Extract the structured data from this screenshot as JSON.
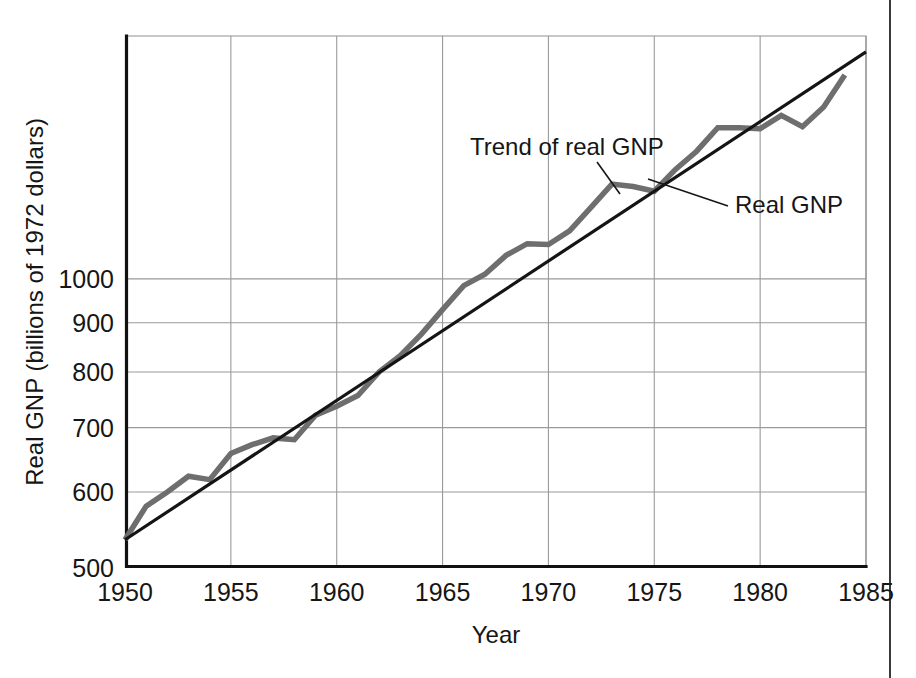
{
  "chart_data": {
    "type": "line",
    "title": "",
    "xlabel": "Year",
    "ylabel": "Real GNP (billions of 1972 dollars)",
    "x_tick_labels": [
      "1950",
      "1955",
      "1960",
      "1965",
      "1970",
      "1975",
      "1980",
      "1985"
    ],
    "x_ticks": [
      1950,
      1955,
      1960,
      1965,
      1970,
      1975,
      1980,
      1985
    ],
    "y_tick_labels": [
      "500",
      "600",
      "700",
      "800",
      "900",
      "1000"
    ],
    "y_ticks": [
      500,
      600,
      700,
      800,
      900,
      1000
    ],
    "yscale": "log",
    "xlim": [
      1950,
      1985
    ],
    "ylim": [
      500,
      1790
    ],
    "grid": true,
    "legend_position": "inline-annotations",
    "series": [
      {
        "name": "Real GNP",
        "color": "#6e6e6e",
        "width": 5.5,
        "x": [
          1950,
          1951,
          1952,
          1953,
          1954,
          1955,
          1956,
          1957,
          1958,
          1959,
          1960,
          1961,
          1962,
          1963,
          1964,
          1965,
          1966,
          1967,
          1968,
          1969,
          1970,
          1971,
          1972,
          1973,
          1974,
          1975,
          1976,
          1977,
          1978,
          1979,
          1980,
          1981,
          1982,
          1983,
          1984
        ],
        "values": [
          535,
          580,
          600,
          623,
          618,
          658,
          672,
          683,
          680,
          721,
          737,
          756,
          800,
          832,
          876,
          929,
          984,
          1011,
          1058,
          1088,
          1086,
          1122,
          1186,
          1255,
          1248,
          1234,
          1300,
          1358,
          1437,
          1437,
          1433,
          1480,
          1440,
          1510,
          1630
        ]
      },
      {
        "name": "Trend of real GNP",
        "color": "#141414",
        "width": 3.2,
        "x": [
          1950,
          1985
        ],
        "values": [
          535,
          1723
        ]
      }
    ],
    "annotations": [
      {
        "name": "trend-of-real-gnp",
        "text": "Trend of real GNP",
        "text_x": 470,
        "text_y": 155,
        "leader": [
          [
            597,
            162
          ],
          [
            620,
            194
          ]
        ]
      },
      {
        "name": "real-gnp",
        "text": "Real GNP",
        "text_x": 735,
        "text_y": 213,
        "leader": [
          [
            728,
            206
          ],
          [
            648,
            179
          ]
        ]
      }
    ],
    "colors": {
      "series_real_gnp": "#6e6e6e",
      "series_trend": "#141414",
      "gridline": "#9a9a9a",
      "axis": "#111111",
      "text": "#161616",
      "background": "#ffffff"
    }
  }
}
